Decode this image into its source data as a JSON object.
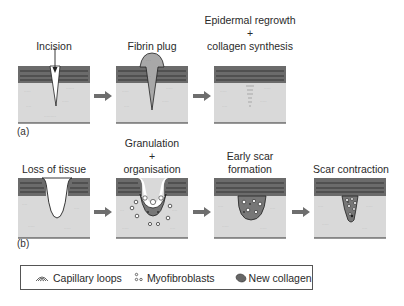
{
  "row_a": {
    "panel_label": "(a)",
    "stages": [
      {
        "label": "Incision"
      },
      {
        "label": "Fibrin plug"
      },
      {
        "label_line1": "Epidermal regrowth",
        "label_plus": "+",
        "label_line2": "collagen synthesis"
      }
    ]
  },
  "row_b": {
    "panel_label": "(b)",
    "stages": [
      {
        "label": "Loss of tissue"
      },
      {
        "label_line1": "Granulation",
        "label_plus": "+",
        "label_line2": "organisation"
      },
      {
        "label_line1": "Early scar",
        "label_line2": "formation"
      },
      {
        "label": "Scar contraction"
      }
    ]
  },
  "legend": {
    "items": [
      {
        "icon": "capillary-loops-icon",
        "label": "Capillary loops"
      },
      {
        "icon": "myofibroblasts-icon",
        "label": "Myofibroblasts"
      },
      {
        "icon": "new-collagen-icon",
        "label": "New collagen"
      }
    ]
  },
  "colors": {
    "epidermis": "#6b6b6b",
    "dermis": "#d9d9d9",
    "fibrin": "#a8a8a8",
    "collagen": "#777777",
    "arrow": "#6e6e6e",
    "outline": "#333333"
  }
}
